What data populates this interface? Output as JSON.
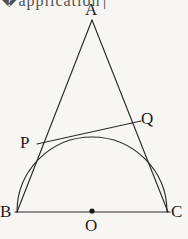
{
  "figure": {
    "background_color": "#f8f6f3",
    "stroke_color": "#2b2b2b",
    "stroke_width": 1.1,
    "canvas": {
      "width": 188,
      "height": 239
    },
    "corner_fragment_text": "�application⏐"
  },
  "labels": {
    "A": "A",
    "B": "B",
    "C": "C",
    "O": "O",
    "P": "P",
    "Q": "Q"
  },
  "geometry": {
    "points": {
      "A": {
        "x": 92,
        "y": 20
      },
      "B": {
        "x": 17,
        "y": 212
      },
      "C": {
        "x": 168,
        "y": 212
      },
      "O": {
        "x": 92,
        "y": 212
      },
      "P": {
        "x": 37,
        "y": 144
      },
      "Q": {
        "x": 140,
        "y": 122
      }
    },
    "semicircle": {
      "center": {
        "x": 92,
        "y": 212
      },
      "radius": 75,
      "start": {
        "x": 17,
        "y": 212
      },
      "end": {
        "x": 167,
        "y": 212
      },
      "orientation": "upper-half"
    },
    "center_dot": {
      "x": 92,
      "y": 211,
      "radius": 2.6
    },
    "segments": [
      {
        "name": "AB",
        "from": "A",
        "to": "B"
      },
      {
        "name": "AC",
        "from": "A",
        "to": "C"
      },
      {
        "name": "BC",
        "from": "B",
        "to": "C"
      },
      {
        "name": "PQ",
        "from": "P",
        "to": "Q"
      }
    ]
  }
}
